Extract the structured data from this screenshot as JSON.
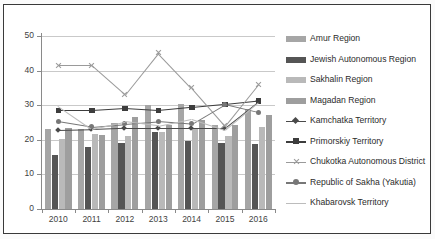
{
  "chart_data": {
    "type": "bar",
    "title": "",
    "xlabel": "",
    "ylabel": "",
    "categories": [
      "2010",
      "2011",
      "2012",
      "2013",
      "2014",
      "2015",
      "2016"
    ],
    "ylim": [
      0,
      50
    ],
    "yticks": [
      "0",
      "10",
      "20",
      "30",
      "40",
      "50"
    ],
    "grid": true,
    "legend_position": "right",
    "series": [
      {
        "name": "Amur Region",
        "kind": "bar",
        "color": "#a6a6a6",
        "values": [
          23.0,
          23.2,
          24.8,
          30.2,
          30.3,
          24.3,
          29.0
        ]
      },
      {
        "name": "Jewish Autonomous Region",
        "kind": "bar",
        "color": "#555555",
        "values": [
          15.5,
          18.0,
          19.2,
          22.2,
          19.6,
          19.0,
          18.9
        ]
      },
      {
        "name": "Sakhalin Region",
        "kind": "bar",
        "color": "#b9b9b9",
        "values": [
          20.1,
          21.6,
          21.0,
          22.3,
          23.0,
          21.0,
          23.6
        ]
      },
      {
        "name": "Magadan Region",
        "kind": "bar",
        "color": "#9e9e9e",
        "values": [
          23.4,
          21.4,
          26.7,
          24.2,
          25.6,
          24.3,
          27.1
        ]
      },
      {
        "name": "Kamchatka Territory",
        "kind": "line",
        "marker": "diamond",
        "color": "#4a4a4a",
        "values": [
          22.8,
          23.0,
          23.4,
          23.4,
          23.4,
          23.4,
          31.0
        ]
      },
      {
        "name": "Primorskiy Territory",
        "kind": "line",
        "marker": "square",
        "color": "#3d3d3d",
        "values": [
          28.5,
          28.5,
          29.1,
          28.5,
          29.4,
          30.3,
          31.3
        ]
      },
      {
        "name": "Chukotka Autonomous District",
        "kind": "line",
        "marker": "x",
        "color": "#9a9a9a",
        "values": [
          41.5,
          41.5,
          33.0,
          45.1,
          35.0,
          24.0,
          36.0
        ]
      },
      {
        "name": "Republic of Sakha (Yakutia)",
        "kind": "line",
        "marker": "circle",
        "color": "#777777",
        "values": [
          25.4,
          23.8,
          24.6,
          25.3,
          24.6,
          30.3,
          28.0
        ]
      },
      {
        "name": "Khabarovsk Territory",
        "kind": "line",
        "marker": "none",
        "color": "#bcbcbc",
        "values": [
          29.8,
          23.2,
          25.3,
          24.1,
          26.1,
          22.9,
          30.9
        ]
      }
    ]
  },
  "legend": {
    "items": [
      {
        "label": "Amur Region"
      },
      {
        "label": "Jewish Autonomous Region"
      },
      {
        "label": "Sakhalin Region"
      },
      {
        "label": "Magadan Region"
      },
      {
        "label": "Kamchatka Territory"
      },
      {
        "label": "Primorskiy Territory"
      },
      {
        "label": "Chukotka Autonomous District"
      },
      {
        "label": "Republic of Sakha (Yakutia)"
      },
      {
        "label": "Khabarovsk Territory"
      }
    ]
  }
}
